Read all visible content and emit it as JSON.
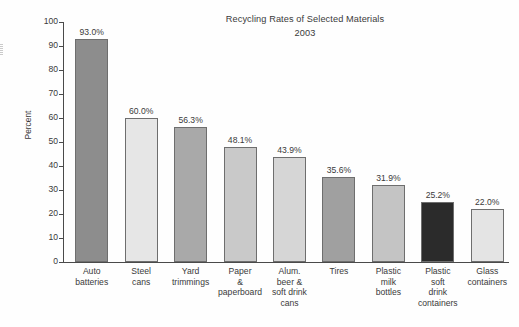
{
  "chart_data": {
    "type": "bar",
    "title": "Recycling Rates of Selected Materials",
    "subtitle": "2003",
    "xlabel": "",
    "ylabel": "Percent",
    "ylim": [
      0,
      100
    ],
    "ytick_step": 10,
    "grid": false,
    "legend": false,
    "categories": [
      "Auto batteries",
      "Steel cans",
      "Yard trimmings",
      "Paper & paperboard",
      "Alum. beer & soft drink cans",
      "Tires",
      "Plastic milk bottles",
      "Plastic soft drink containers",
      "Glass containers"
    ],
    "values": [
      93.0,
      60.0,
      56.3,
      48.1,
      43.9,
      35.6,
      31.9,
      25.2,
      22.0
    ],
    "value_labels": [
      "93.0%",
      "60.0%",
      "56.3%",
      "48.1%",
      "43.9%",
      "35.6%",
      "31.9%",
      "25.2%",
      "22.0%"
    ],
    "tick_labels": [
      "100",
      "90",
      "80",
      "70",
      "60",
      "50",
      "40",
      "30",
      "20",
      "10",
      "0"
    ],
    "bar_colors": [
      "#8d8d8d",
      "#e6e6e6",
      "#a9a9a9",
      "#c9c9c9",
      "#d6d6d6",
      "#a0a0a0",
      "#c4c4c4",
      "#2b2b2b",
      "#e4e4e4"
    ],
    "bar_border_color": "#6e6e6e",
    "axis_color": "#4a4a4a",
    "text_color": "#3a3a3a",
    "background_color": "#fefefe",
    "category_label_lines": [
      [
        "Auto",
        "batteries"
      ],
      [
        "Steel",
        "cans"
      ],
      [
        "Yard",
        "trimmings"
      ],
      [
        "Paper",
        "&",
        "paperboard"
      ],
      [
        "Alum.",
        "beer &",
        "soft drink",
        "cans"
      ],
      [
        "Tires"
      ],
      [
        "Plastic",
        "milk",
        "bottles"
      ],
      [
        "Plastic",
        "soft",
        "drink",
        "containers"
      ],
      [
        "Glass",
        "containers"
      ]
    ]
  }
}
